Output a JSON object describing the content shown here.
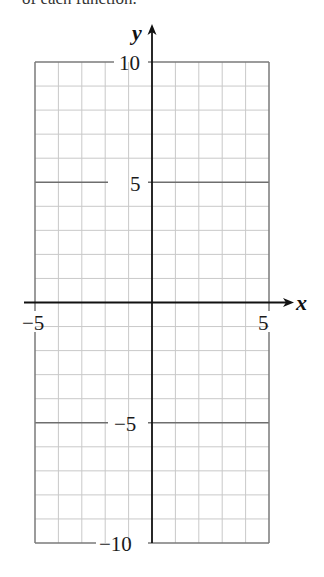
{
  "caption": "of each function.",
  "chart_data": {
    "type": "line",
    "title": "",
    "xlabel": "x",
    "ylabel": "y",
    "xlim": [
      -5,
      5
    ],
    "ylim": [
      -10,
      10
    ],
    "grid": true,
    "grid_step": 1,
    "x_tick_labels": [
      "−5",
      "5"
    ],
    "x_ticks": [
      -5,
      5
    ],
    "y_tick_labels": [
      "10",
      "5",
      "−5",
      "−10"
    ],
    "y_ticks": [
      10,
      5,
      -5,
      -10
    ],
    "series": [],
    "legend": null
  },
  "colors": {
    "axis": "#111111",
    "border": "#7a7a7a",
    "grid": "#c9c9c9",
    "major_grid": "#6e6e6e"
  }
}
